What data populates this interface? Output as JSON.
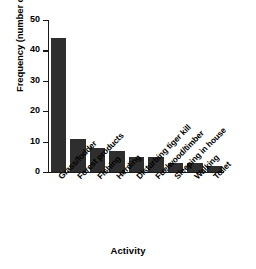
{
  "chart_data": {
    "type": "bar",
    "title": "",
    "xlabel": "Activity",
    "ylabel": "Frequency (number of people)",
    "categories": [
      "Grass/fodder",
      "Forest products",
      "Fishing",
      "Herding",
      "Disturbing tiger kill",
      "Fuelwood/timber",
      "Sleeping in house",
      "Walking",
      "Toilet"
    ],
    "values": [
      44,
      11,
      8,
      7,
      5,
      5,
      3,
      3,
      2
    ],
    "ylim": [
      0,
      50
    ],
    "yticks": [
      0,
      10,
      20,
      30,
      40,
      50
    ],
    "ytick_labels": [
      "0",
      "10",
      "20",
      "30",
      "40",
      "50"
    ],
    "grid": false,
    "legend": false,
    "bar_color": "#2e2e2e",
    "axis_color": "#1a1a1a",
    "background": "#ffffff"
  }
}
